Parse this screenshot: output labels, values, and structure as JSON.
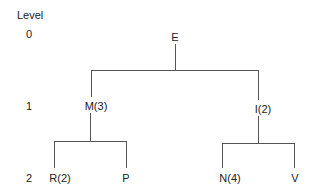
{
  "diagram": {
    "type": "tree",
    "level_header": "Level",
    "levels": [
      {
        "label": "0",
        "y": 31
      },
      {
        "label": "1",
        "y": 104
      },
      {
        "label": "2",
        "y": 176
      }
    ],
    "nodes": {
      "root": {
        "label": "E",
        "level": 0,
        "x": 175,
        "y": 35
      },
      "m": {
        "label": "M(3)",
        "level": 1,
        "x": 97,
        "y": 104
      },
      "i": {
        "label": "I(2)",
        "level": 1,
        "x": 262,
        "y": 108
      },
      "r": {
        "label": "R(2)",
        "level": 2,
        "x": 58,
        "y": 176
      },
      "p": {
        "label": "P",
        "level": 2,
        "x": 126,
        "y": 176
      },
      "n": {
        "label": "N(4)",
        "level": 2,
        "x": 229,
        "y": 176
      },
      "v": {
        "label": "V",
        "level": 2,
        "x": 295,
        "y": 176
      }
    },
    "edges": [
      [
        "E",
        "M(3)"
      ],
      [
        "E",
        "I(2)"
      ],
      [
        "M(3)",
        "R(2)"
      ],
      [
        "M(3)",
        "P"
      ],
      [
        "I(2)",
        "N(4)"
      ],
      [
        "I(2)",
        "V"
      ]
    ],
    "line_color": "#555555"
  }
}
